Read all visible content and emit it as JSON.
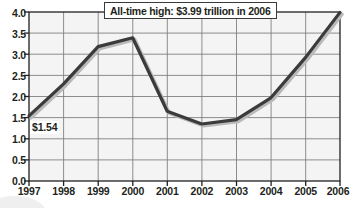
{
  "chart_data": {
    "type": "line",
    "title": "",
    "subtitle": "",
    "xlabel": "",
    "ylabel": "",
    "categories": [
      "1997",
      "1998",
      "1999",
      "2000",
      "2001",
      "2002",
      "2003",
      "2004",
      "2005",
      "2006"
    ],
    "x": [
      1997,
      1998,
      1999,
      2000,
      2001,
      2002,
      2003,
      2004,
      2005,
      2006
    ],
    "values": [
      1.54,
      2.3,
      3.18,
      3.39,
      1.65,
      1.35,
      1.45,
      1.97,
      2.92,
      3.99
    ],
    "series": [
      {
        "name": "Value",
        "values": [
          1.54,
          2.3,
          3.18,
          3.39,
          1.65,
          1.35,
          1.45,
          1.97,
          2.92,
          3.99
        ]
      }
    ],
    "ylim": [
      0.0,
      4.0
    ],
    "yticks": [
      "0.0",
      "0.5",
      "1.0",
      "1.5",
      "2.0",
      "2.5",
      "3.0",
      "3.5",
      "4.0"
    ],
    "ytick_values": [
      0.0,
      0.5,
      1.0,
      1.5,
      2.0,
      2.5,
      3.0,
      3.5,
      4.0
    ],
    "xticks": [
      "1997",
      "1998",
      "1999",
      "2000",
      "2001",
      "2002",
      "2003",
      "2004",
      "2005",
      "2006"
    ],
    "grid": true,
    "grid_x": true,
    "grid_y": true,
    "legend": false,
    "legend_position": "none",
    "annotations": [
      {
        "name": "all-time-high-callout",
        "text": "All-time high: $3.99 trillion in 2006",
        "target_x": "2006",
        "target_y": 3.99
      },
      {
        "name": "first-point-value-label",
        "text": "$1.54",
        "target_x": "1997",
        "target_y": 1.54
      }
    ],
    "colors": {
      "line": "#3b3b3b",
      "line_shadow": "#b9b9b9",
      "grid": "#808080",
      "axis": "#231f20",
      "plot_background": "#f4f4f4",
      "page_background": "#ffffff",
      "callout_border": "#3a3a3a",
      "callout_background": "#ffffff",
      "text": "#231f20"
    }
  }
}
